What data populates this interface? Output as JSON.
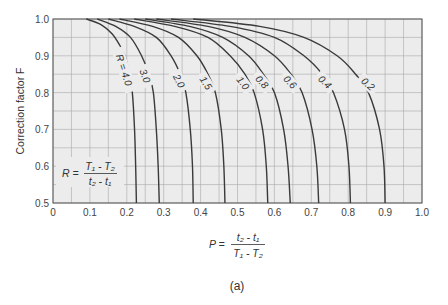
{
  "chart_data": {
    "type": "line",
    "title": "",
    "xlabel": "P = (t2 - t1) / (T1 - T2)",
    "ylabel": "Correction factor F",
    "xlim": [
      0,
      1.0
    ],
    "ylim": [
      0.5,
      1.0
    ],
    "x_ticks": [
      "0",
      "0.1",
      "0.2",
      "0.3",
      "0.4",
      "0.5",
      "0.6",
      "0.7",
      "0.8",
      "0.9",
      "1.0"
    ],
    "y_ticks": [
      "0.5",
      "0.6",
      "0.7",
      "0.8",
      "0.9",
      "1.0"
    ],
    "grid": true,
    "grid_minor_step_x": 0.05,
    "grid_minor_step_y": 0.05,
    "parameter_legend": "R = (T1 - T2) / (t2 - t1)",
    "caption": "(a)",
    "series": [
      {
        "name": "R = 4.0",
        "label": "R = 4.0",
        "points": [
          [
            0.09,
            1.0
          ],
          [
            0.13,
            0.985
          ],
          [
            0.16,
            0.96
          ],
          [
            0.18,
            0.93
          ],
          [
            0.195,
            0.9
          ],
          [
            0.207,
            0.85
          ],
          [
            0.215,
            0.8
          ],
          [
            0.221,
            0.7
          ],
          [
            0.224,
            0.6
          ],
          [
            0.226,
            0.5
          ]
        ]
      },
      {
        "name": "R = 3.0",
        "label": "3.0",
        "points": [
          [
            0.12,
            1.0
          ],
          [
            0.17,
            0.98
          ],
          [
            0.21,
            0.95
          ],
          [
            0.24,
            0.9
          ],
          [
            0.26,
            0.85
          ],
          [
            0.272,
            0.8
          ],
          [
            0.28,
            0.7
          ],
          [
            0.285,
            0.6
          ],
          [
            0.288,
            0.5
          ]
        ]
      },
      {
        "name": "R = 2.0",
        "label": "2.0",
        "points": [
          [
            0.15,
            1.0
          ],
          [
            0.22,
            0.98
          ],
          [
            0.28,
            0.95
          ],
          [
            0.32,
            0.9
          ],
          [
            0.345,
            0.85
          ],
          [
            0.36,
            0.8
          ],
          [
            0.372,
            0.7
          ],
          [
            0.378,
            0.6
          ],
          [
            0.38,
            0.5
          ]
        ]
      },
      {
        "name": "R = 1.5",
        "label": "1.5",
        "points": [
          [
            0.18,
            1.0
          ],
          [
            0.27,
            0.98
          ],
          [
            0.34,
            0.95
          ],
          [
            0.39,
            0.9
          ],
          [
            0.42,
            0.85
          ],
          [
            0.44,
            0.8
          ],
          [
            0.456,
            0.7
          ],
          [
            0.463,
            0.6
          ],
          [
            0.466,
            0.5
          ]
        ]
      },
      {
        "name": "R = 1.0",
        "label": "1.0",
        "points": [
          [
            0.22,
            1.0
          ],
          [
            0.33,
            0.98
          ],
          [
            0.42,
            0.95
          ],
          [
            0.48,
            0.9
          ],
          [
            0.52,
            0.85
          ],
          [
            0.545,
            0.8
          ],
          [
            0.568,
            0.7
          ],
          [
            0.578,
            0.6
          ],
          [
            0.582,
            0.5
          ]
        ]
      },
      {
        "name": "R = 0.8",
        "label": "0.8",
        "points": [
          [
            0.25,
            1.0
          ],
          [
            0.37,
            0.98
          ],
          [
            0.46,
            0.95
          ],
          [
            0.53,
            0.9
          ],
          [
            0.57,
            0.85
          ],
          [
            0.6,
            0.8
          ],
          [
            0.625,
            0.7
          ],
          [
            0.637,
            0.6
          ],
          [
            0.643,
            0.5
          ]
        ]
      },
      {
        "name": "R = 0.6",
        "label": "0.6",
        "points": [
          [
            0.28,
            1.0
          ],
          [
            0.42,
            0.98
          ],
          [
            0.52,
            0.95
          ],
          [
            0.6,
            0.9
          ],
          [
            0.645,
            0.85
          ],
          [
            0.675,
            0.8
          ],
          [
            0.702,
            0.7
          ],
          [
            0.715,
            0.6
          ],
          [
            0.72,
            0.5
          ]
        ]
      },
      {
        "name": "R = 0.4",
        "label": "0.4",
        "points": [
          [
            0.32,
            1.0
          ],
          [
            0.48,
            0.98
          ],
          [
            0.6,
            0.95
          ],
          [
            0.68,
            0.9
          ],
          [
            0.73,
            0.85
          ],
          [
            0.76,
            0.8
          ],
          [
            0.79,
            0.7
          ],
          [
            0.802,
            0.6
          ],
          [
            0.806,
            0.5
          ]
        ]
      },
      {
        "name": "R = 0.2",
        "label": "0.2",
        "points": [
          [
            0.38,
            1.0
          ],
          [
            0.56,
            0.98
          ],
          [
            0.68,
            0.95
          ],
          [
            0.77,
            0.9
          ],
          [
            0.82,
            0.85
          ],
          [
            0.855,
            0.8
          ],
          [
            0.885,
            0.7
          ],
          [
            0.897,
            0.6
          ],
          [
            0.9,
            0.5
          ]
        ]
      }
    ]
  },
  "labels": {
    "ylabel": "Correction factor F",
    "r_formula_lhs": "R =",
    "r_formula_num": "T₁ - T₂",
    "r_formula_den": "t₂ - t₁",
    "p_formula_lhs": "P =",
    "p_formula_num": "t₂ - t₁",
    "p_formula_den": "T₁ - T₂",
    "caption": "(a)"
  },
  "colors": {
    "plot_bg": "#ececec",
    "grid": "#a8a8a8",
    "axis": "#555555",
    "curve": "#3a3a3a"
  }
}
